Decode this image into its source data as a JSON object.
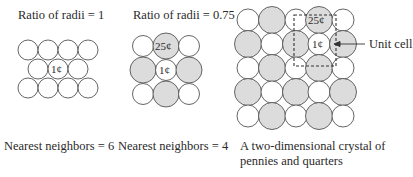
{
  "panels": [
    {
      "title": "Ratio of radii = 1",
      "caption": "Nearest neighbors = 6",
      "center_label": "1¢"
    },
    {
      "title": "Ratio of radii = 0.75",
      "caption": "Nearest neighbors = 4",
      "top_label": "25¢",
      "center_label": "1¢"
    },
    {
      "caption_line1": "A two-dimensional crystal of",
      "caption_line2": "pennies and quarters",
      "top_label": "25¢",
      "center_label": "1¢",
      "annotation": "Unit cell"
    }
  ],
  "colors": {
    "quarter_fill": "#dcdcdc",
    "penny_fill": "#ffffff",
    "stroke": "#555555"
  }
}
